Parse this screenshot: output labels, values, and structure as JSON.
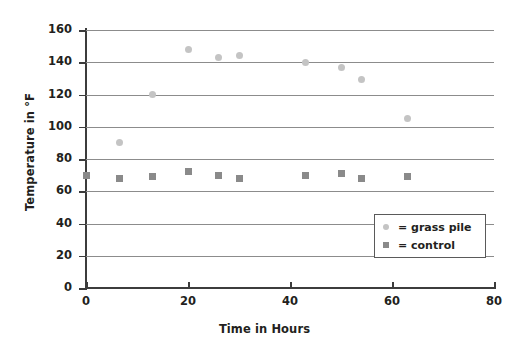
{
  "chart_data": {
    "type": "scatter",
    "title": "",
    "xlabel": "Time in Hours",
    "ylabel": "Temperature in °F",
    "xlim": [
      0,
      80
    ],
    "ylim": [
      0,
      160
    ],
    "xticks": [
      0,
      20,
      40,
      60,
      80
    ],
    "yticks": [
      0,
      20,
      40,
      60,
      80,
      100,
      120,
      140,
      160
    ],
    "grid": true,
    "legend_position": "inside-right",
    "series": [
      {
        "name": "grass pile",
        "marker": "circle",
        "color": "#c4c4c4",
        "points": [
          {
            "x": 6.6,
            "y": 90
          },
          {
            "x": 13,
            "y": 120
          },
          {
            "x": 20,
            "y": 148
          },
          {
            "x": 26,
            "y": 143
          },
          {
            "x": 30,
            "y": 144
          },
          {
            "x": 43,
            "y": 140
          },
          {
            "x": 50,
            "y": 137
          },
          {
            "x": 54,
            "y": 129
          },
          {
            "x": 63,
            "y": 105
          }
        ]
      },
      {
        "name": "control",
        "marker": "square",
        "color": "#8a8a8a",
        "points": [
          {
            "x": 0,
            "y": 70
          },
          {
            "x": 6.6,
            "y": 68
          },
          {
            "x": 13,
            "y": 69
          },
          {
            "x": 20,
            "y": 72
          },
          {
            "x": 26,
            "y": 70
          },
          {
            "x": 30,
            "y": 68
          },
          {
            "x": 43,
            "y": 70
          },
          {
            "x": 50,
            "y": 71
          },
          {
            "x": 54,
            "y": 68
          },
          {
            "x": 63,
            "y": 69
          }
        ]
      }
    ]
  },
  "axes": {
    "y_title": "Temperature in °F",
    "x_title": "Time in Hours",
    "y_tick_labels": [
      "160",
      "140",
      "120",
      "100",
      "80",
      "60",
      "40",
      "20",
      "0"
    ],
    "x_tick_labels": [
      "0",
      "20",
      "40",
      "60",
      "80"
    ]
  },
  "legend": {
    "entries": [
      {
        "label": "= grass pile",
        "marker": "circle"
      },
      {
        "label": "= control",
        "marker": "square"
      }
    ]
  }
}
